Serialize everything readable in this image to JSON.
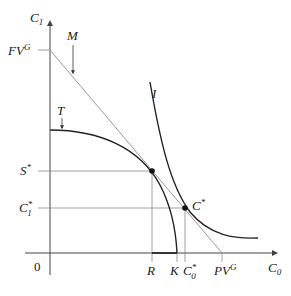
{
  "diagram": {
    "type": "economics-intertemporal-choice",
    "axes": {
      "y_label": "C",
      "y_label_sub": "1",
      "x_label": "C",
      "x_label_sub": "0",
      "origin_label": "0"
    },
    "y_labels": {
      "fv": "FV",
      "fv_sup": "G",
      "s_star": "S",
      "s_star_sup": "*",
      "c1_star": "C",
      "c1_star_sub": "1",
      "c1_star_sup": "*"
    },
    "x_labels": {
      "r": "R",
      "k": "K",
      "c0_star": "C",
      "c0_star_sub": "0",
      "c0_star_sup": "*",
      "pv": "PV",
      "pv_sup": "G"
    },
    "curve_labels": {
      "market_line": "M",
      "transformation_curve": "T",
      "indifference_curve": "I",
      "optimum": "C",
      "optimum_sup": "*"
    },
    "colors": {
      "axis": "#444444",
      "guide": "#888888",
      "market_line": "#999999",
      "curve": "#222222",
      "point": "#111111"
    }
  }
}
